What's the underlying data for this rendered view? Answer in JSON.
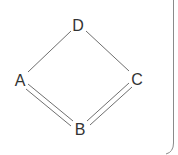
{
  "diagram": {
    "type": "graph",
    "nodes": [
      {
        "id": "D",
        "label": "D",
        "x": 78,
        "y": 25
      },
      {
        "id": "A",
        "label": "A",
        "x": 20,
        "y": 80
      },
      {
        "id": "C",
        "label": "C",
        "x": 137,
        "y": 79
      },
      {
        "id": "B",
        "label": "B",
        "x": 80,
        "y": 129
      }
    ],
    "edges": [
      {
        "from": "D",
        "to": "A",
        "bond": "single"
      },
      {
        "from": "D",
        "to": "C",
        "bond": "single"
      },
      {
        "from": "A",
        "to": "B",
        "bond": "double"
      },
      {
        "from": "B",
        "to": "C",
        "bond": "double"
      }
    ],
    "colors": {
      "edge": "#6f6f6f",
      "label": "#333333",
      "frame": "#8a8a8a"
    }
  }
}
